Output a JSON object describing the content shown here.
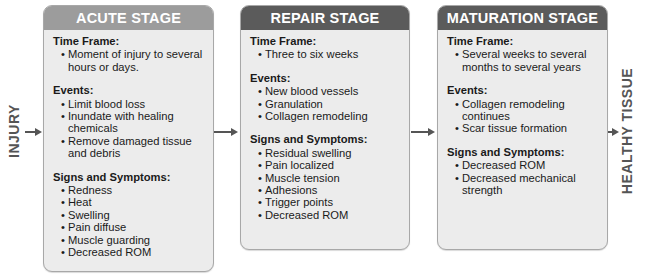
{
  "labels": {
    "start": "INJURY",
    "end": "HEALTHY TISSUE"
  },
  "colors": {
    "acute_header": "#9c9c9c",
    "stage_header_dark": "#5b5b5b",
    "box_fill": "#ececec",
    "arrow": "#555555"
  },
  "stages": [
    {
      "title": "ACUTE STAGE",
      "sections": [
        {
          "title": "Time Frame:",
          "items": [
            "Moment of injury to several hours or days."
          ]
        },
        {
          "title": "Events:",
          "items": [
            "Limit blood loss",
            "Inundate with healing chemicals",
            "Remove damaged tissue and debris"
          ]
        },
        {
          "title": "Signs and Symptoms:",
          "items": [
            "Redness",
            "Heat",
            "Swelling",
            "Pain diffuse",
            "Muscle guarding",
            "Decreased ROM"
          ]
        }
      ]
    },
    {
      "title": "REPAIR STAGE",
      "sections": [
        {
          "title": "Time Frame:",
          "items": [
            "Three to six weeks"
          ]
        },
        {
          "title": "Events:",
          "items": [
            "New blood vessels",
            "Granulation",
            "Collagen remodeling"
          ]
        },
        {
          "title": "Signs and Symptoms:",
          "items": [
            "Residual swelling",
            "Pain localized",
            "Muscle tension",
            "Adhesions",
            "Trigger points",
            "Decreased ROM"
          ]
        }
      ]
    },
    {
      "title": "MATURATION STAGE",
      "sections": [
        {
          "title": "Time Frame:",
          "items": [
            "Several weeks to several months to several years"
          ]
        },
        {
          "title": "Events:",
          "items": [
            "Collagen remodeling continues",
            "Scar tissue formation"
          ]
        },
        {
          "title": "Signs and Symptoms:",
          "items": [
            "Decreased ROM",
            "Decreased mechanical strength"
          ]
        }
      ]
    }
  ]
}
